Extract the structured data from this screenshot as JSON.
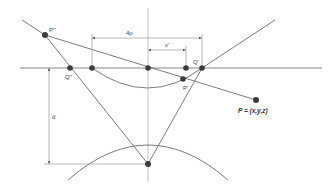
{
  "figure": {
    "type": "geometric-construction",
    "labels": {
      "p_double_prime": "P''",
      "q_double_prime": "Q''",
      "q_prime": "Q'",
      "p_prime": "P'",
      "point_p": "P = (x,y,z)",
      "dim_4p": "4p",
      "dim_x_prime": "x'",
      "dim_d": "d"
    },
    "colors": {
      "line": "#6e6e6e",
      "point": "#3c3c3c",
      "axis_vertical": "#c4c4c4",
      "background": "#ffffff"
    }
  }
}
